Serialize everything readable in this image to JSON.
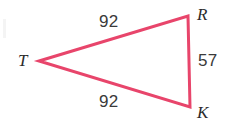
{
  "figure": {
    "kind": "isosceles-triangle-diagram",
    "stroke_color": "#E8456B",
    "stroke_width": 3,
    "background_color": "#FFFFFF",
    "label_color": "#2B2B2B",
    "number_color": "#3A3A3A",
    "vertices": [
      {
        "name": "T",
        "label": "T",
        "x": 39,
        "y": 61
      },
      {
        "name": "R",
        "label": "R",
        "x": 188,
        "y": 16
      },
      {
        "name": "K",
        "label": "K",
        "x": 190,
        "y": 107
      }
    ],
    "sides": [
      {
        "name": "TR",
        "label": "92",
        "from": "T",
        "to": "R"
      },
      {
        "name": "TK",
        "label": "92",
        "from": "T",
        "to": "K"
      },
      {
        "name": "RK",
        "label": "57",
        "from": "R",
        "to": "K"
      }
    ]
  },
  "chart_data": {
    "type": "diagram",
    "title": "",
    "shape": "triangle",
    "vertex_labels": [
      "T",
      "R",
      "K"
    ],
    "side_labels": [
      "92",
      "92",
      "57"
    ],
    "points": [
      [
        39,
        61
      ],
      [
        188,
        16
      ],
      [
        190,
        107
      ]
    ]
  }
}
